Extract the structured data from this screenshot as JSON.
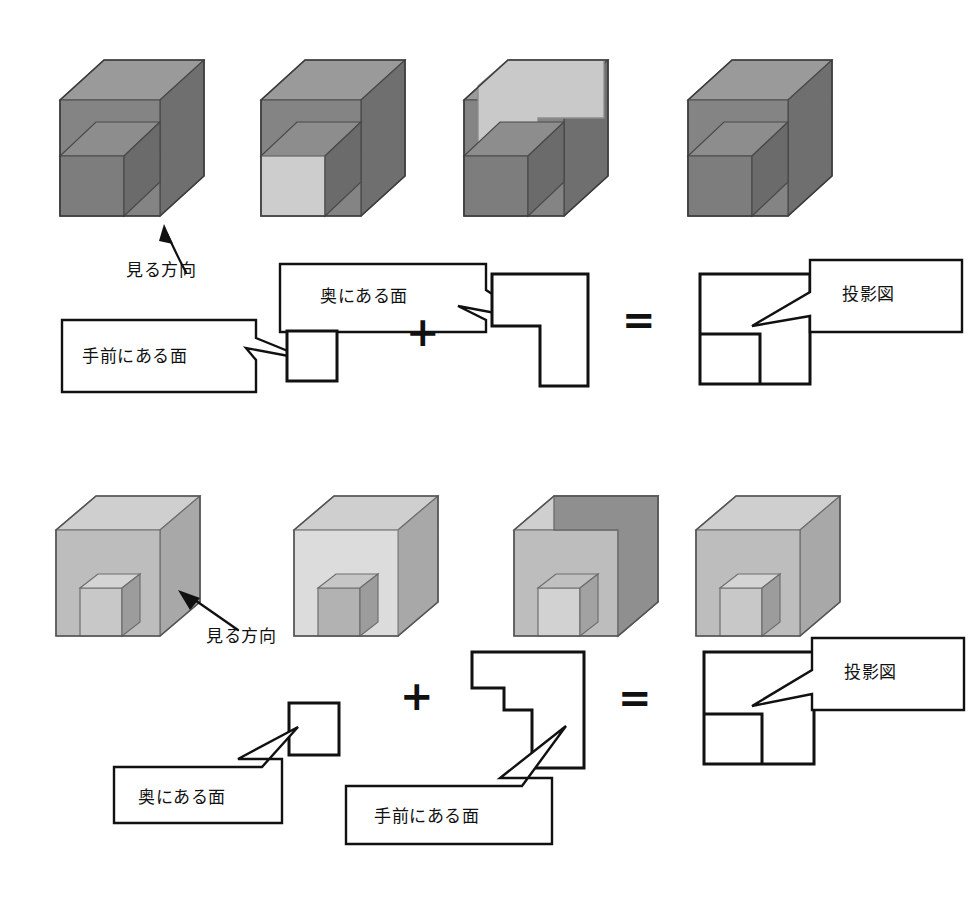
{
  "page": {
    "background": "#ffffff",
    "width": 975,
    "height": 913
  },
  "palette": {
    "outline": "#111111",
    "top_solid_base": "#848484",
    "top_solid_top": "#9a9a9a",
    "top_solid_side": "#6f6f6f",
    "top_solid_highlight": "#c9c9c9",
    "bottom_solid_base": "#bdbdbd",
    "bottom_solid_top": "#cfcfcf",
    "bottom_solid_side": "#a8a8a8",
    "bottom_solid_highlight": "#dcdcdc",
    "bottom_solid_shade": "#9c9c9c"
  },
  "labels": {
    "view_direction": "見る方向",
    "back_face": "奥にある面",
    "front_face": "手前にある面",
    "projection": "投影図",
    "plus": "+",
    "equals": "="
  },
  "rows": [
    {
      "id": "row-top",
      "solid_tone": "dark",
      "solids": [
        {
          "id": "top-solid-1",
          "highlight": "none",
          "caption": "見る方向"
        },
        {
          "id": "top-solid-2",
          "highlight": "front",
          "caption": ""
        },
        {
          "id": "top-solid-3",
          "highlight": "back",
          "caption": ""
        },
        {
          "id": "top-solid-4",
          "highlight": "none",
          "caption": ""
        }
      ],
      "equation": {
        "operand_a": {
          "name": "front-face-shape",
          "shape": "square",
          "label": "手前にある面"
        },
        "operator_1": "+",
        "operand_b": {
          "name": "back-face-shape",
          "shape": "l-shape",
          "label": "奥にある面"
        },
        "operator_2": "=",
        "result": {
          "name": "projection-shape",
          "shape": "square-with-inner-square",
          "label": "投影図"
        }
      }
    },
    {
      "id": "row-bottom",
      "solid_tone": "light",
      "solids": [
        {
          "id": "bottom-solid-1",
          "highlight": "none",
          "caption": "見る方向"
        },
        {
          "id": "bottom-solid-2",
          "highlight": "front",
          "caption": ""
        },
        {
          "id": "bottom-solid-3",
          "highlight": "back",
          "caption": ""
        },
        {
          "id": "bottom-solid-4",
          "highlight": "none",
          "caption": ""
        }
      ],
      "equation": {
        "operand_a": {
          "name": "back-face-shape",
          "shape": "square",
          "label": "奥にある面"
        },
        "operator_1": "+",
        "operand_b": {
          "name": "front-face-shape",
          "shape": "l-shape-notch",
          "label": "手前にある面"
        },
        "operator_2": "=",
        "result": {
          "name": "projection-shape",
          "shape": "square-with-inner-square",
          "label": "投影図"
        }
      }
    }
  ]
}
